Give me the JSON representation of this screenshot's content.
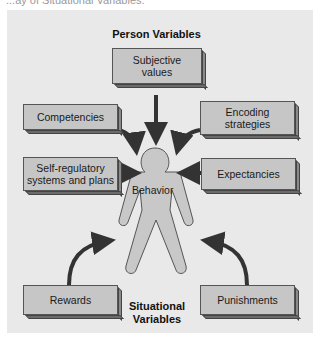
{
  "caption": "...ay of Situational Variables.",
  "person_heading": "Person Variables",
  "situational_heading_line1": "Situational",
  "situational_heading_line2": "Variables",
  "center_label": "Behavior",
  "boxes": {
    "subjective_values": {
      "line1": "Subjective",
      "line2": "values"
    },
    "competencies": {
      "line1": "Competencies"
    },
    "encoding_strategies": {
      "line1": "Encoding",
      "line2": "strategies"
    },
    "self_regulatory": {
      "line1": "Self-regulatory",
      "line2": "systems and plans"
    },
    "expectancies": {
      "line1": "Expectancies"
    },
    "rewards": {
      "line1": "Rewards"
    },
    "punishments": {
      "line1": "Punishments"
    }
  },
  "colors": {
    "panel": "#e9e9e9",
    "box": "#c6c6c6",
    "figure": "#c8c8c8",
    "arrow": "#333333"
  }
}
